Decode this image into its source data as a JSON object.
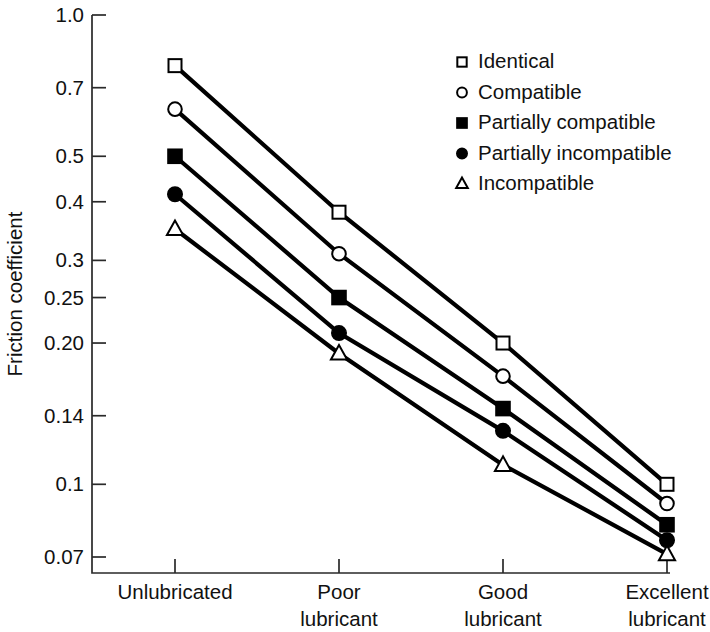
{
  "chart_data": {
    "type": "line",
    "title": "",
    "xlabel": "",
    "ylabel": "Friction coefficient",
    "yscale": "log",
    "ylim": [
      0.07,
      1.0
    ],
    "grid": false,
    "legend_position": "top-right",
    "categories": [
      "Unlubricated",
      "Poor lubricant",
      "Good lubricant",
      "Excellent lubricant"
    ],
    "category_lines": [
      [
        "Unlubricated",
        ""
      ],
      [
        "Poor",
        "lubricant"
      ],
      [
        "Good",
        "lubricant"
      ],
      [
        "Excellent",
        "lubricant"
      ]
    ],
    "ytick_labels": [
      "1.0",
      "0.7",
      "0.5",
      "0.4",
      "0.3",
      "0.25",
      "0.20",
      "0.14",
      "0.1",
      "0.07"
    ],
    "ytick_values": [
      1.0,
      0.7,
      0.5,
      0.4,
      0.3,
      0.25,
      0.2,
      0.14,
      0.1,
      0.07
    ],
    "series": [
      {
        "name": "Identical",
        "marker": "open-square",
        "values": [
          0.78,
          0.38,
          0.2,
          0.1
        ]
      },
      {
        "name": "Compatible",
        "marker": "open-circle",
        "values": [
          0.63,
          0.31,
          0.17,
          0.091
        ]
      },
      {
        "name": "Partially compatible",
        "marker": "filled-square",
        "values": [
          0.5,
          0.25,
          0.145,
          0.082
        ]
      },
      {
        "name": "Partially incompatible",
        "marker": "filled-circle",
        "values": [
          0.415,
          0.21,
          0.13,
          0.076
        ]
      },
      {
        "name": "Incompatible",
        "marker": "open-triangle",
        "values": [
          0.35,
          0.19,
          0.11,
          0.071
        ]
      }
    ]
  },
  "legend": {
    "items": [
      {
        "label": "Identical",
        "marker": "open-square"
      },
      {
        "label": "Compatible",
        "marker": "open-circle"
      },
      {
        "label": "Partially compatible",
        "marker": "filled-square"
      },
      {
        "label": "Partially incompatible",
        "marker": "filled-circle"
      },
      {
        "label": "Incompatible",
        "marker": "open-triangle"
      }
    ]
  },
  "colors": {
    "ink": "#000000",
    "axis": "#2a2a2a",
    "background": "#ffffff"
  }
}
